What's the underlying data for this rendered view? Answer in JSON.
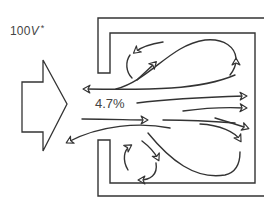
{
  "diagram": {
    "type": "airflow-pattern",
    "labels": {
      "velocity_value": "100",
      "velocity_unit": "V",
      "velocity_mark": "*",
      "percent": "4.7%"
    },
    "colors": {
      "stroke": "#333333",
      "background": "#ffffff"
    },
    "elements": {
      "inlet_arrow": "large-hollow-arrow-pointing-right",
      "enclosure": "double-walled-box-open-on-left",
      "flows": [
        "upper-recirculation-loop",
        "lower-recirculation-loop",
        "central-through-flow",
        "upper-return-to-inlet",
        "lower-return-to-inlet",
        "upper-corner-eddy",
        "lower-corner-eddy"
      ]
    }
  }
}
